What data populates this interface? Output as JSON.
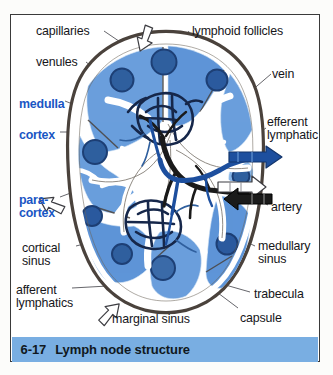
{
  "figure": {
    "frame_border_color": "#3a3a3a",
    "page_background": "#fcfcfa"
  },
  "caption": {
    "number": "6-17",
    "text": "Lymph node structure",
    "bar_color": "#79aee2",
    "text_color": "#101820"
  },
  "palette": {
    "capsule": "#4a423c",
    "cortex_blue": "#5e95d8",
    "cortex_blue_light": "#86b4e6",
    "follicle_navy": "#2b5a9e",
    "follicle_dark": "#1d3f75",
    "sinus_white": "#ffffff",
    "artery_black": "#1a1a1a",
    "vein_blue": "#1d4f9e",
    "capillary_dark": "#16274a",
    "label_black": "#16161a",
    "label_blue": "#1a56c4",
    "leader_line": "#4a4a50"
  },
  "labels": [
    {
      "id": "capillaries",
      "text": "capillaries",
      "color": "black",
      "x": 36,
      "y": 25,
      "align": "left"
    },
    {
      "id": "lymphoid-follicles",
      "text": "lymphoid follicles",
      "color": "black",
      "x": 192,
      "y": 25,
      "align": "left"
    },
    {
      "id": "venules",
      "text": "venules",
      "color": "black",
      "x": 36,
      "y": 56,
      "align": "left"
    },
    {
      "id": "vein",
      "text": "vein",
      "color": "black",
      "x": 272,
      "y": 68,
      "align": "left"
    },
    {
      "id": "medulla",
      "text": "medulla",
      "color": "blue",
      "x": 19,
      "y": 98,
      "align": "left"
    },
    {
      "id": "cortex",
      "text": "cortex",
      "color": "blue",
      "x": 19,
      "y": 129,
      "align": "left"
    },
    {
      "id": "efferent-lymphatic",
      "text": "efferent\nlymphatic",
      "color": "black",
      "x": 267,
      "y": 116,
      "align": "left"
    },
    {
      "id": "paracortex",
      "text": "para-\ncortex",
      "color": "blue",
      "x": 19,
      "y": 194,
      "align": "left"
    },
    {
      "id": "artery",
      "text": "artery",
      "color": "black",
      "x": 271,
      "y": 201,
      "align": "left"
    },
    {
      "id": "cortical-sinus",
      "text": "cortical\nsinus",
      "color": "black",
      "x": 22,
      "y": 242,
      "align": "left"
    },
    {
      "id": "medullary-sinus",
      "text": "medullary\nsinus",
      "color": "black",
      "x": 258,
      "y": 240,
      "align": "left"
    },
    {
      "id": "afferent-lymphatics",
      "text": "afferent\nlymphatics",
      "color": "black",
      "x": 16,
      "y": 284,
      "align": "left"
    },
    {
      "id": "trabecula",
      "text": "trabecula",
      "color": "black",
      "x": 254,
      "y": 288,
      "align": "left"
    },
    {
      "id": "marginal-sinus",
      "text": "marginal sinus",
      "color": "black",
      "x": 112,
      "y": 313,
      "align": "left"
    },
    {
      "id": "capsule",
      "text": "capsule",
      "color": "black",
      "x": 240,
      "y": 312,
      "align": "left"
    }
  ],
  "arrows": [
    {
      "id": "afferent-lymphatic-arrow-top",
      "style": "white-outline",
      "direction": "down-right"
    },
    {
      "id": "afferent-lymphatic-arrow-left",
      "style": "white-outline",
      "direction": "down-right"
    },
    {
      "id": "afferent-lymphatic-arrow-bottom",
      "style": "white-outline",
      "direction": "up-right"
    },
    {
      "id": "vein-arrow",
      "style": "blue-solid",
      "direction": "right"
    },
    {
      "id": "efferent-lymphatic-arrow",
      "style": "white-outline",
      "direction": "right"
    },
    {
      "id": "artery-arrow",
      "style": "black-solid",
      "direction": "left"
    }
  ],
  "structures": {
    "capsule": "outer dark brown fibrous capsule",
    "cortex_lobes": 7,
    "follicles": 9,
    "capillary_tangles": 2,
    "hilum": "central white sinus region at right"
  }
}
